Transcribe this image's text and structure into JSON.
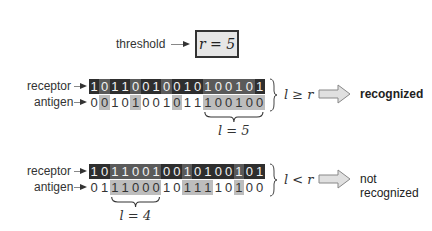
{
  "threshold": {
    "label": "threshold",
    "value_text": "r = 5"
  },
  "comparisons": [
    {
      "receptor_label": "receptor",
      "antigen_label": "antigen",
      "receptor_bits": "10110010010100101",
      "antigen_bits": "00101001011100100",
      "receptor_highlight": [
        0,
        1,
        0,
        0,
        1,
        0,
        0,
        1,
        0,
        0,
        0,
        1,
        1,
        1,
        1,
        1,
        0
      ],
      "antigen_highlight": [
        0,
        1,
        0,
        0,
        1,
        0,
        0,
        0,
        1,
        0,
        0,
        1,
        1,
        1,
        1,
        1,
        1
      ],
      "brace_label": "l = 5",
      "brace_start": 11,
      "brace_end": 16,
      "condition": "l ≥ r",
      "result": "recognized",
      "result_bold": true
    },
    {
      "receptor_label": "receptor",
      "antigen_label": "antigen",
      "receptor_bits": "10110010010100101",
      "antigen_bits": "01110001011110100",
      "receptor_highlight": [
        0,
        0,
        1,
        1,
        1,
        1,
        1,
        0,
        0,
        1,
        0,
        0,
        0,
        0,
        1,
        0,
        0
      ],
      "antigen_highlight": [
        0,
        0,
        1,
        1,
        1,
        1,
        1,
        0,
        0,
        1,
        1,
        1,
        0,
        0,
        1,
        0,
        0
      ],
      "brace_label": "l = 4",
      "brace_start": 2,
      "brace_end": 6,
      "condition": "l < r",
      "result": "not recognized",
      "result_bold": false
    }
  ],
  "colors": {
    "receptor_bg": "#2e2e2e",
    "highlight": "#bdbdbd",
    "box_bg": "#e6e6e6"
  }
}
